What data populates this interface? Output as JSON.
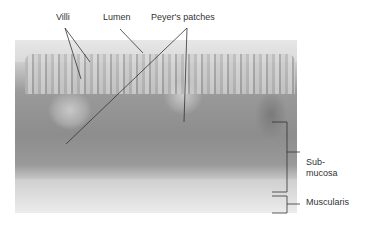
{
  "figure": {
    "labels": {
      "villi": "Villi",
      "lumen": "Lumen",
      "peyers_patches": "Peyer's patches",
      "submucosa_line1": "Sub-",
      "submucosa_line2": "mucosa",
      "muscularis": "Muscularis"
    },
    "colors": {
      "leader_line": "#333333",
      "tissue_dark": "#8d8d8d",
      "tissue_light": "#e4e4e4"
    }
  }
}
